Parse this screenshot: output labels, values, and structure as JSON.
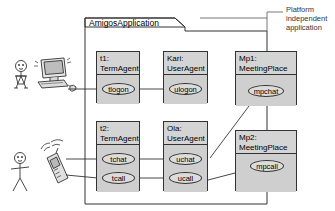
{
  "diagram": {
    "type": "uml-collaboration-diagram",
    "package": {
      "name": "AmigosApplication"
    },
    "annotation": {
      "lines": [
        "Platform",
        "independent",
        "application"
      ]
    },
    "actors": [
      {
        "id": "actor-top",
        "kind": "person-female",
        "device": "desktop-computer"
      },
      {
        "id": "actor-bottom",
        "kind": "person-male",
        "device": "mobile-phone"
      }
    ],
    "objects": [
      {
        "id": "t1",
        "name_line1": "t1:",
        "name_line2": "TermAgent",
        "operations": [
          {
            "id": "tlogon",
            "label": "tlogon"
          }
        ]
      },
      {
        "id": "kari",
        "name_line1": "Kari:",
        "name_line2": "UserAgent",
        "operations": [
          {
            "id": "ulogon",
            "label": "ulogon"
          }
        ]
      },
      {
        "id": "mp1",
        "name_line1": "Mp1:",
        "name_line2": "MeetingPlace",
        "operations": [
          {
            "id": "mpchat",
            "label": "mpchat"
          }
        ]
      },
      {
        "id": "t2",
        "name_line1": "t2:",
        "name_line2": "TermAgent",
        "operations": [
          {
            "id": "tchat",
            "label": "tchat"
          },
          {
            "id": "tcall",
            "label": "tcall"
          }
        ]
      },
      {
        "id": "ola",
        "name_line1": "Ola:",
        "name_line2": "UserAgent",
        "operations": [
          {
            "id": "uchat",
            "label": "uchat"
          },
          {
            "id": "ucall",
            "label": "ucall"
          }
        ]
      },
      {
        "id": "mp2",
        "name_line1": "Mp2:",
        "name_line2": "MeetingPlace",
        "operations": [
          {
            "id": "mpcall",
            "label": "mpcall"
          }
        ]
      }
    ],
    "connections": [
      {
        "from": "desktop-computer",
        "to": "tlogon"
      },
      {
        "from": "tlogon",
        "to": "ulogon"
      },
      {
        "from": "mpchat",
        "to": "uchat"
      },
      {
        "from": "mobile-phone",
        "to": "tchat"
      },
      {
        "from": "mobile-phone",
        "to": "tcall"
      },
      {
        "from": "tchat",
        "to": "uchat"
      },
      {
        "from": "tcall",
        "to": "ucall"
      },
      {
        "from": "ucall",
        "to": "mpcall"
      },
      {
        "from": "package",
        "to": "annotation"
      }
    ],
    "colors": {
      "stroke": "#333333",
      "box_fill": "#d4d4d4",
      "body_fill": "#cfcfcf",
      "ellipse_fill": "#dcdcdc",
      "background": "#ffffff"
    }
  }
}
